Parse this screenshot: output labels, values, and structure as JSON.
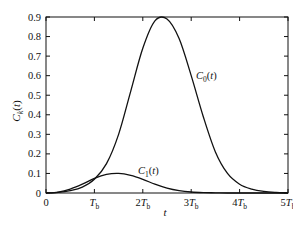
{
  "chart_data": {
    "type": "line",
    "title": "",
    "xlabel": "t",
    "ylabel": "C_k(t)",
    "xlim": [
      0,
      5
    ],
    "ylim": [
      0,
      0.9
    ],
    "grid": false,
    "legend": "inline labels",
    "x_ticks": [
      {
        "value": 0,
        "label": "0"
      },
      {
        "value": 1,
        "label": "T",
        "sub": "b"
      },
      {
        "value": 2,
        "label": "2T",
        "sub": "b"
      },
      {
        "value": 3,
        "label": "3T",
        "sub": "b"
      },
      {
        "value": 4,
        "label": "4T",
        "sub": "b"
      },
      {
        "value": 5,
        "label": "5T",
        "sub": "b"
      }
    ],
    "y_ticks": [
      "0",
      "0.1",
      "0.2",
      "0.3",
      "0.4",
      "0.5",
      "0.6",
      "0.7",
      "0.8",
      "0.9"
    ],
    "series": [
      {
        "name": "C_0(t)",
        "label_main": "C",
        "label_sub": "0",
        "label_tail": "(t)",
        "x": [
          0,
          0.25,
          0.5,
          0.75,
          1.0,
          1.25,
          1.5,
          1.75,
          2.0,
          2.25,
          2.5,
          2.75,
          3.0,
          3.25,
          3.5,
          3.75,
          4.0,
          4.25,
          4.5,
          4.75,
          5.0
        ],
        "values": [
          0,
          0.003,
          0.012,
          0.03,
          0.07,
          0.15,
          0.3,
          0.52,
          0.74,
          0.88,
          0.89,
          0.79,
          0.6,
          0.39,
          0.21,
          0.1,
          0.045,
          0.02,
          0.008,
          0.003,
          0.001
        ]
      },
      {
        "name": "C_1(t)",
        "label_main": "C",
        "label_sub": "1",
        "label_tail": "(t)",
        "x": [
          0,
          0.25,
          0.5,
          0.75,
          1.0,
          1.25,
          1.5,
          1.75,
          2.0,
          2.25,
          2.5,
          2.75,
          3.0,
          3.25,
          3.5,
          3.75,
          4.0,
          4.25,
          4.5,
          4.75,
          5.0
        ],
        "values": [
          0,
          0.005,
          0.02,
          0.045,
          0.075,
          0.095,
          0.1,
          0.09,
          0.07,
          0.045,
          0.025,
          0.012,
          0.005,
          0.002,
          0.001,
          0,
          0,
          0,
          0,
          0,
          0
        ]
      }
    ]
  }
}
